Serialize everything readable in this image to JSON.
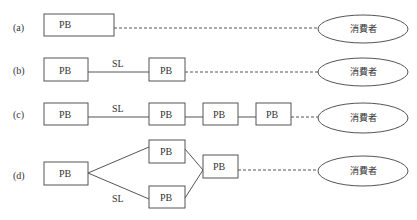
{
  "diagram": {
    "rows": [
      {
        "id": "a",
        "label": "(a)",
        "nodes": [
          "PB"
        ],
        "link_label": "",
        "end": "消費者"
      },
      {
        "id": "b",
        "label": "(b)",
        "nodes": [
          "PB",
          "PB"
        ],
        "link_label": "SL",
        "end": "消費者"
      },
      {
        "id": "c",
        "label": "(c)",
        "nodes": [
          "PB",
          "PB",
          "PB",
          "PB"
        ],
        "link_label": "SL",
        "end": "消費者"
      },
      {
        "id": "d",
        "label": "(d)",
        "nodes": [
          "PB",
          "PB",
          "PB",
          "PB"
        ],
        "link_label": "SL",
        "end": "消費者"
      }
    ],
    "node_label": "PB",
    "link_label": "SL",
    "consumer_label": "消費者",
    "legend": {
      "solid_line": "SL",
      "dashed_line": "to consumer"
    }
  }
}
